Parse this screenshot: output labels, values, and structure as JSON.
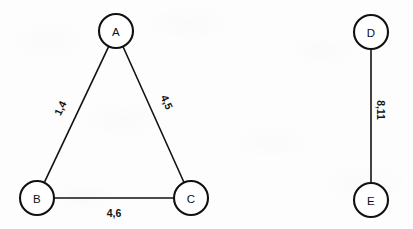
{
  "diagram": {
    "background_color": "#fdfdfd",
    "stroke_color": "#111111",
    "node_fill_color": "#ffffff",
    "graphs": [
      {
        "id": "graph-left",
        "name": "triangle-graph",
        "nodes": [
          {
            "id": "A",
            "label": "A",
            "cx": 116,
            "cy": 31,
            "r": 17
          },
          {
            "id": "B",
            "label": "B",
            "cx": 37,
            "cy": 198,
            "r": 17
          },
          {
            "id": "C",
            "label": "C",
            "cx": 191,
            "cy": 198,
            "r": 17
          }
        ],
        "edges": [
          {
            "id": "A-B",
            "from": "A",
            "to": "B",
            "label": "1,4",
            "label_x": 60,
            "label_y": 108,
            "label_rotation": -64.7
          },
          {
            "id": "A-C",
            "from": "A",
            "to": "C",
            "label": "4,5",
            "label_x": 167,
            "label_y": 102,
            "label_rotation": 65.9
          },
          {
            "id": "B-C",
            "from": "B",
            "to": "C",
            "label": "4,6",
            "label_x": 114,
            "label_y": 213,
            "label_rotation": 0
          }
        ]
      },
      {
        "id": "graph-right",
        "name": "pair-graph",
        "nodes": [
          {
            "id": "D",
            "label": "D",
            "cx": 371,
            "cy": 32,
            "r": 17
          },
          {
            "id": "E",
            "label": "E",
            "cx": 371,
            "cy": 200,
            "r": 17
          }
        ],
        "edges": [
          {
            "id": "D-E",
            "from": "D",
            "to": "E",
            "label": "8,11",
            "label_x": 381,
            "label_y": 110,
            "label_rotation": 90
          }
        ]
      }
    ]
  }
}
